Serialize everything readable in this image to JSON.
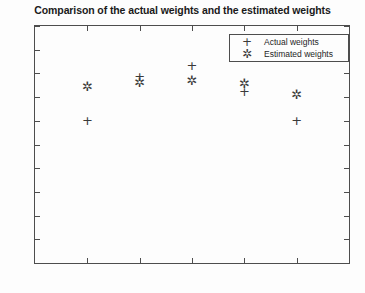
{
  "chart_data": {
    "type": "scatter",
    "title": "Comparison of the actual weights and the estimated weights",
    "xlabel": "",
    "ylabel": "",
    "xlim": [
      0,
      6
    ],
    "ylim": [
      -0.5,
      0.5
    ],
    "xticks": [
      "0",
      "1",
      "2",
      "3",
      "4",
      "5",
      "6"
    ],
    "xtick_values": [
      0,
      1,
      2,
      3,
      4,
      5,
      6
    ],
    "yticks": [
      "0.5",
      "0.4",
      "0.3",
      "0.2",
      "0.1",
      "0",
      "-0.1",
      "-0.2",
      "-0.3",
      "-0.4",
      "-0.5"
    ],
    "ytick_values": [
      0.5,
      0.4,
      0.3,
      0.2,
      0.1,
      0,
      -0.1,
      -0.2,
      -0.3,
      -0.4,
      -0.5
    ],
    "grid": false,
    "legend_position": "upper right",
    "x": [
      1,
      2,
      3,
      4,
      5
    ],
    "series": [
      {
        "name": "Actual weights",
        "marker": "+",
        "color": "#3a3a3a",
        "values": [
          0.1,
          0.285,
          0.335,
          0.225,
          0.1
        ]
      },
      {
        "name": "Estimated weights",
        "marker": "*",
        "color": "#3a3a3a",
        "values": [
          0.245,
          0.262,
          0.272,
          0.258,
          0.21
        ]
      }
    ]
  },
  "legend": {
    "entries": [
      {
        "symbol": "+",
        "label": "Actual weights"
      },
      {
        "symbol": "✲",
        "label": "Estimated weights"
      }
    ]
  }
}
